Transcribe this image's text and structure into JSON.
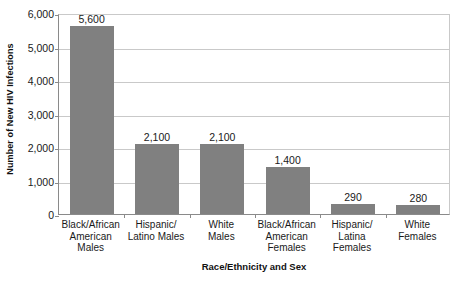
{
  "chart_data": {
    "type": "bar",
    "title": "",
    "xlabel": "Race/Ethnicity and Sex",
    "ylabel": "Number of New HIV Infections",
    "categories": [
      "Black/African American Males",
      "Hispanic/ Latino Males",
      "White Males",
      "Black/African American Females",
      "Hispanic/ Latina Females",
      "White Females"
    ],
    "category_lines": [
      [
        "Black/African",
        "American",
        "Males"
      ],
      [
        "Hispanic/",
        "Latino Males"
      ],
      [
        "White",
        "Males"
      ],
      [
        "Black/African",
        "American",
        "Females"
      ],
      [
        "Hispanic/",
        "Latina",
        "Females"
      ],
      [
        "White",
        "Females"
      ]
    ],
    "values": [
      5600,
      2100,
      2100,
      1400,
      290,
      280
    ],
    "value_labels": [
      "5,600",
      "2,100",
      "2,100",
      "1,400",
      "290",
      "280"
    ],
    "ylim": [
      0,
      6000
    ],
    "ytick_values": [
      0,
      1000,
      2000,
      3000,
      4000,
      5000,
      6000
    ],
    "ytick_labels": [
      "0",
      "1,000",
      "2,000",
      "3,000",
      "4,000",
      "5,000",
      "6,000"
    ],
    "grid": true,
    "legend": false,
    "bar_color": "#808080",
    "gridline_color": "#c9c9c9",
    "axis_color": "#8a8a8a",
    "background_color": "#ffffff"
  }
}
